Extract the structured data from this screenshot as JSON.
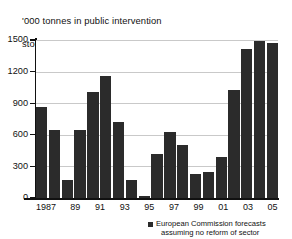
{
  "chart_data": {
    "type": "bar",
    "title": "'000 tonnes in public intervention\nstocks at year-end",
    "title_line1": "'000 tonnes in public intervention",
    "title_line2": "stocks at year-end",
    "xlabel": "",
    "ylabel": "",
    "ylim": [
      0,
      1500
    ],
    "yticks": [
      0,
      300,
      600,
      900,
      1200,
      1500
    ],
    "ytick_labels": [
      "0",
      "300",
      "600",
      "900",
      "1200",
      "1500"
    ],
    "grid": true,
    "grid_axis": "y",
    "legend_position": "bottom-right",
    "bar_color": "#2b2b2b",
    "grid_color": "#c9c9c9",
    "axis_color": "#111111",
    "categories": [
      "1987",
      "88",
      "89",
      "90",
      "91",
      "92",
      "93",
      "94",
      "95",
      "96",
      "97",
      "98",
      "99",
      "00",
      "01",
      "02",
      "03",
      "04",
      "05"
    ],
    "tick_labels": [
      "1987",
      "",
      "89",
      "",
      "91",
      "",
      "93",
      "",
      "95",
      "",
      "97",
      "",
      "99",
      "",
      "01",
      "",
      "03",
      "",
      "05"
    ],
    "values": [
      860,
      645,
      175,
      645,
      1010,
      1160,
      720,
      170,
      15,
      420,
      625,
      500,
      225,
      245,
      390,
      1030,
      1410,
      1490,
      1475
    ],
    "series": [
      {
        "name": "European Commission forecasts assuming no reform of sector",
        "values": [
          860,
          645,
          175,
          645,
          1010,
          1160,
          720,
          170,
          15,
          420,
          625,
          500,
          225,
          245,
          390,
          1030,
          1410,
          1490,
          1475
        ]
      }
    ],
    "legend": [
      {
        "label_line1": "European Commission forecasts",
        "label_line2": "assuming no reform of sector",
        "color": "#2b2b2b",
        "marker": "square"
      }
    ]
  }
}
